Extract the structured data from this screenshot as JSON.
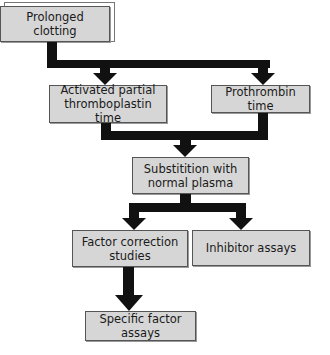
{
  "diagram": {
    "title": "",
    "nodes": [
      {
        "id": "prolonged_clotting",
        "label": "Prolonged clotting"
      },
      {
        "id": "aptt",
        "label": "Activated partial thromboplastin time"
      },
      {
        "id": "pt",
        "label": "Prothrombin time"
      },
      {
        "id": "substitution",
        "label": "Substitition with normal plasma"
      },
      {
        "id": "factor_correction",
        "label": "Factor correction studies"
      },
      {
        "id": "inhibitor_assays",
        "label": "Inhibitor assays"
      },
      {
        "id": "specific_factor",
        "label": "Specific factor assays"
      }
    ],
    "edges": [
      {
        "from": "prolonged_clotting",
        "to": "aptt"
      },
      {
        "from": "prolonged_clotting",
        "to": "pt"
      },
      {
        "from": "aptt",
        "to": "substitution"
      },
      {
        "from": "pt",
        "to": "substitution"
      },
      {
        "from": "substitution",
        "to": "factor_correction"
      },
      {
        "from": "substitution",
        "to": "inhibitor_assays"
      },
      {
        "from": "factor_correction",
        "to": "specific_factor"
      }
    ],
    "colors": {
      "box_fill": "#d6d6d6",
      "box_border": "#555555",
      "arrow": "#111111"
    }
  }
}
